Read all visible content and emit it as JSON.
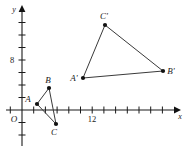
{
  "figure": {
    "type": "coordinate-plane-triangles",
    "axes": {
      "x_label": "x",
      "y_label": "y",
      "origin_label": "O",
      "x_tick_label": "12",
      "y_tick_label": "8",
      "x_tick_label_value": 12,
      "y_tick_label_value": 8,
      "x_range": [
        -1,
        26
      ],
      "y_range": [
        -3,
        18
      ],
      "tick_step": 2,
      "grid": false
    },
    "triangles": [
      {
        "name": "ABC",
        "vertices": [
          {
            "label": "A",
            "x": 1.3,
            "y": 1.0,
            "px": 37,
            "py": 104,
            "label_dx": -9,
            "label_dy": -2
          },
          {
            "label": "B",
            "x": 3.4,
            "y": 3.8,
            "px": 49,
            "py": 88,
            "label_dx": -1,
            "label_dy": -5
          },
          {
            "label": "C",
            "x": 4.6,
            "y": -2.4,
            "px": 56,
            "py": 124,
            "label_dx": -2,
            "label_dy": 11
          }
        ]
      },
      {
        "name": "A'B'C'",
        "vertices": [
          {
            "label": "A'",
            "x": 9.6,
            "y": 5.6,
            "px": 83,
            "py": 78,
            "label_dx": -10,
            "label_dy": 1
          },
          {
            "label": "B'",
            "x": 23.5,
            "y": 6.8,
            "px": 163,
            "py": 71,
            "label_dx": 4,
            "label_dy": 1
          },
          {
            "label": "C'",
            "x": 13.6,
            "y": 14.8,
            "px": 105,
            "py": 25,
            "label_dx": -2,
            "label_dy": -5
          }
        ]
      }
    ],
    "colors": {
      "axis": "#1a1a1a",
      "edge": "#3a3a3a",
      "vertex": "#111111",
      "background": "#ffffff"
    }
  }
}
